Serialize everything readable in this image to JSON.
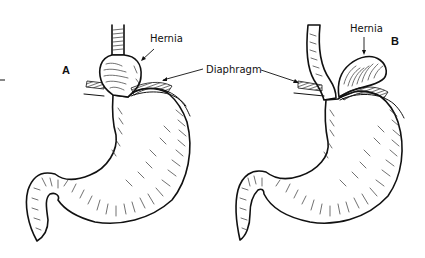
{
  "figure": {
    "type": "medical-illustration",
    "panels": [
      {
        "id": "A",
        "panel_label": "A",
        "hernia_label": "Hernia"
      },
      {
        "id": "B",
        "panel_label": "B",
        "hernia_label": "Hernia"
      }
    ],
    "shared_label": "Diaphragm",
    "colors": {
      "ink": "#111111",
      "background": "#ffffff"
    }
  }
}
